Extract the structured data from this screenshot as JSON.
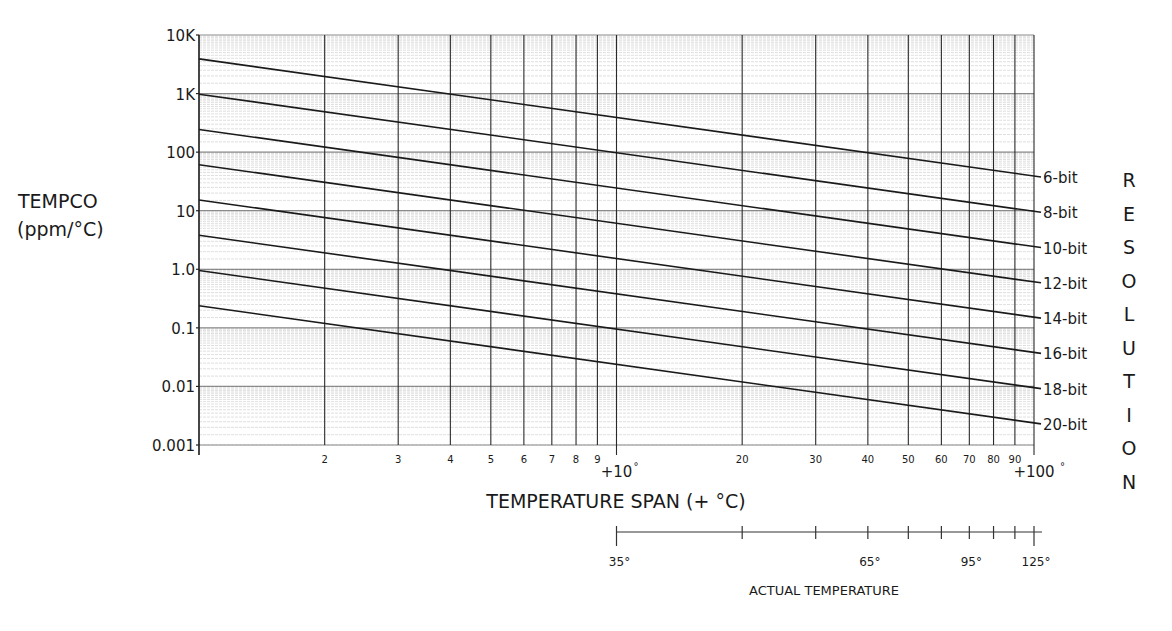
{
  "chart_data": {
    "type": "line",
    "title": "",
    "xlabel": "TEMPERATURE SPAN (+ °C)",
    "ylabel": "TEMPCO (ppm/°C)",
    "ylabel_lines": [
      "TEMPCO",
      "(ppm/°C)"
    ],
    "xscale": "log",
    "yscale": "log",
    "xlim": [
      1,
      100
    ],
    "ylim": [
      0.001,
      10000
    ],
    "grid": true,
    "y_ticks": [
      {
        "value": 10000,
        "label": "10K"
      },
      {
        "value": 1000,
        "label": "1K"
      },
      {
        "value": 100,
        "label": "100"
      },
      {
        "value": 10,
        "label": "10"
      },
      {
        "value": 1,
        "label": "1.0"
      },
      {
        "value": 0.1,
        "label": "0.1"
      },
      {
        "value": 0.01,
        "label": "0.01"
      },
      {
        "value": 0.001,
        "label": "0.001"
      }
    ],
    "x_ticks": [
      {
        "value": 1,
        "label": ""
      },
      {
        "value": 2,
        "label": "2"
      },
      {
        "value": 3,
        "label": "3"
      },
      {
        "value": 4,
        "label": "4"
      },
      {
        "value": 5,
        "label": "5"
      },
      {
        "value": 6,
        "label": "6"
      },
      {
        "value": 7,
        "label": "7"
      },
      {
        "value": 8,
        "label": "8"
      },
      {
        "value": 9,
        "label": "9"
      },
      {
        "value": 10,
        "label": "+10°"
      },
      {
        "value": 20,
        "label": "20"
      },
      {
        "value": 30,
        "label": "30"
      },
      {
        "value": 40,
        "label": "40"
      },
      {
        "value": 50,
        "label": "50"
      },
      {
        "value": 60,
        "label": "60"
      },
      {
        "value": 70,
        "label": "70"
      },
      {
        "value": 80,
        "label": "80"
      },
      {
        "value": 90,
        "label": "90"
      },
      {
        "value": 100,
        "label": "+100°"
      }
    ],
    "legend_title": "RESOLUTION",
    "legend_position": "right",
    "x": [
      1,
      10,
      100
    ],
    "series": [
      {
        "name": "6-bit",
        "values": [
          3906,
          390.6,
          39.06
        ]
      },
      {
        "name": "8-bit",
        "values": [
          976.6,
          97.66,
          9.766
        ]
      },
      {
        "name": "10-bit",
        "values": [
          244.1,
          24.41,
          2.441
        ]
      },
      {
        "name": "12-bit",
        "values": [
          61.04,
          6.104,
          0.6104
        ]
      },
      {
        "name": "14-bit",
        "values": [
          15.26,
          1.526,
          0.1526
        ]
      },
      {
        "name": "16-bit",
        "values": [
          3.815,
          0.3815,
          0.03815
        ]
      },
      {
        "name": "18-bit",
        "values": [
          0.9537,
          0.09537,
          0.009537
        ]
      },
      {
        "name": "20-bit",
        "values": [
          0.2384,
          0.02384,
          0.002384
        ]
      }
    ],
    "secondary_x_axis": {
      "label": "ACTUAL TEMPERATURE",
      "span_range": [
        10,
        100
      ],
      "tick_spans": [
        10,
        20,
        30,
        40,
        50,
        60,
        70,
        80,
        90,
        100
      ],
      "labeled_ticks": [
        {
          "span": 10,
          "label": "35°"
        },
        {
          "span": 40,
          "label": "65°"
        },
        {
          "span": 70,
          "label": "95°"
        },
        {
          "span": 100,
          "label": "125°"
        }
      ]
    }
  }
}
